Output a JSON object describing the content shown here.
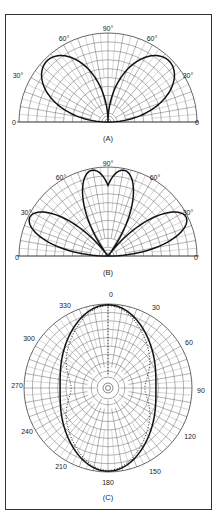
{
  "figure": {
    "panels": [
      {
        "id": "A",
        "caption": "(A)",
        "type": "half-polar",
        "labels": {
          "left0": "0",
          "left30": "30°",
          "left60": "60°",
          "top90": "90°",
          "right60": "60°",
          "right30": "30°",
          "right0": "0"
        },
        "lobe_angles_deg": [
          30,
          150
        ]
      },
      {
        "id": "B",
        "caption": "(B)",
        "type": "half-polar",
        "labels": {
          "left0": "0",
          "left30": "30°",
          "left60": "60°",
          "top90": "90°",
          "right60": "60°",
          "right30": "30°",
          "right0": "0"
        },
        "lobe_angles_deg": [
          13,
          60,
          120,
          167
        ]
      },
      {
        "id": "C",
        "caption": "(C)",
        "type": "full-polar",
        "labels": [
          "0",
          "30",
          "60",
          "90",
          "120",
          "150",
          "180",
          "210",
          "240",
          "270",
          "300",
          "330"
        ]
      }
    ]
  },
  "chart_data": [
    {
      "type": "polar",
      "title": "(A)",
      "range_deg": [
        0,
        180
      ],
      "tick_labels": [
        "0",
        "30°",
        "60°",
        "90°",
        "60°",
        "30°",
        "0"
      ],
      "series": [
        {
          "name": "pattern",
          "lobes": [
            {
              "angle": 30,
              "relative_gain": 1.0
            },
            {
              "angle": 150,
              "relative_gain": 1.0
            }
          ],
          "null_at": [
            0,
            90,
            180
          ]
        }
      ]
    },
    {
      "type": "polar",
      "title": "(B)",
      "range_deg": [
        0,
        180
      ],
      "tick_labels": [
        "0",
        "30°",
        "60°",
        "90°",
        "60°",
        "30°",
        "0"
      ],
      "series": [
        {
          "name": "pattern",
          "lobes": [
            {
              "angle": 13,
              "relative_gain": 1.0
            },
            {
              "angle": 60,
              "relative_gain": 0.95
            },
            {
              "angle": 120,
              "relative_gain": 0.95
            },
            {
              "angle": 167,
              "relative_gain": 1.0
            }
          ],
          "null_at": [
            0,
            35,
            90,
            145,
            180
          ]
        }
      ]
    },
    {
      "type": "polar",
      "title": "(C)",
      "range_deg": [
        0,
        360
      ],
      "tick_labels": [
        "0",
        "30",
        "60",
        "90",
        "120",
        "150",
        "180",
        "210",
        "240",
        "270",
        "300",
        "330"
      ],
      "series": [
        {
          "name": "solid",
          "style": "solid",
          "description": "near-omnidirectional, slightly pinched at 90/270",
          "relative_gain_at": {
            "0": 1.0,
            "90": 0.6,
            "180": 1.0,
            "270": 0.6
          }
        },
        {
          "name": "dotted",
          "style": "dotted",
          "description": "figure-eight-like, deeper pinch at 90/270",
          "relative_gain_at": {
            "0": 1.0,
            "90": 0.45,
            "180": 1.0,
            "270": 0.45
          }
        }
      ]
    }
  ]
}
